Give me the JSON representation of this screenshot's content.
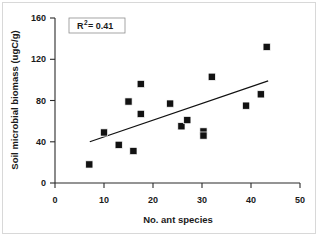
{
  "chart_data": {
    "type": "scatter",
    "title": "",
    "xlabel": "No. ant species",
    "ylabel": "Soil microbial biomass (ugC/g)",
    "xlim": [
      0,
      50
    ],
    "ylim": [
      0,
      160
    ],
    "xticks": [
      0,
      10,
      20,
      30,
      40,
      50
    ],
    "yticks": [
      0,
      40,
      80,
      120,
      160
    ],
    "xtick_labels": [
      "0",
      "10",
      "20",
      "30",
      "40",
      "50"
    ],
    "ytick_labels": [
      "0",
      "40",
      "80",
      "120",
      "160"
    ],
    "grid": false,
    "legend": null,
    "marker": "filled-square",
    "marker_color": "#121212",
    "points": [
      {
        "x": 7.0,
        "y": 18
      },
      {
        "x": 10.0,
        "y": 49
      },
      {
        "x": 13.0,
        "y": 37
      },
      {
        "x": 15.0,
        "y": 79
      },
      {
        "x": 16.0,
        "y": 31
      },
      {
        "x": 17.5,
        "y": 96
      },
      {
        "x": 17.5,
        "y": 67
      },
      {
        "x": 23.5,
        "y": 77
      },
      {
        "x": 25.8,
        "y": 55
      },
      {
        "x": 27.0,
        "y": 61
      },
      {
        "x": 30.3,
        "y": 50
      },
      {
        "x": 30.3,
        "y": 46
      },
      {
        "x": 32.0,
        "y": 103
      },
      {
        "x": 39.0,
        "y": 75
      },
      {
        "x": 42.0,
        "y": 86
      },
      {
        "x": 43.2,
        "y": 132
      }
    ],
    "trendline": {
      "x_start": 7.1,
      "y_start": 40,
      "x_end": 43.5,
      "y_end": 99
    },
    "annotations": [
      {
        "name": "r-squared-box",
        "prefix": "R",
        "superscript": "2",
        "suffix": " = 0.41",
        "text": "R2 = 0.41",
        "value": 0.41,
        "x": 8.5,
        "y": 152
      }
    ]
  }
}
